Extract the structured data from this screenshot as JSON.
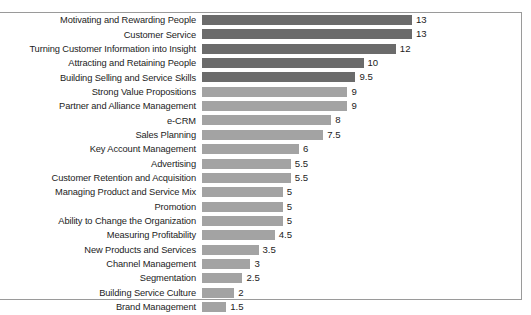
{
  "chart_data": {
    "type": "bar",
    "orientation": "horizontal",
    "title": "",
    "subtitle": "",
    "xlabel": "",
    "ylabel": "",
    "xlim": [
      0,
      13
    ],
    "grid": false,
    "legend": "none",
    "value_label_position": "outside-end",
    "colors": {
      "high_group": "#6b6b6b",
      "low_group": "#a3a3a3",
      "frame": "#9a9a9a",
      "background": "#ffffff",
      "text": "#1c1c1c"
    },
    "categories": [
      "Motivating and Rewarding People",
      "Customer Service",
      "Turning Customer Information into Insight",
      "Attracting and Retaining People",
      "Building Selling and Service Skills",
      "Strong Value Propositions",
      "Partner and Alliance Management",
      "e-CRM",
      "Sales Planning",
      "Key Account Management",
      "Advertising",
      "Customer Retention and Acquisition",
      "Managing Product and Service Mix",
      "Promotion",
      "Ability to Change the Organization",
      "Measuring Profitability",
      "New Products and Services",
      "Channel Management",
      "Segmentation",
      "Building Service Culture",
      "Brand Management"
    ],
    "values": [
      13,
      13,
      12,
      10,
      9.5,
      9,
      9,
      8,
      7.5,
      6,
      5.5,
      5.5,
      5,
      5,
      5,
      4.5,
      3.5,
      3,
      2.5,
      2,
      1.5
    ],
    "value_labels": [
      "13",
      "13",
      "12",
      "10",
      "9.5",
      "9",
      "9",
      "8",
      "7.5",
      "6",
      "5.5",
      "5.5",
      "5",
      "5",
      "5",
      "4.5",
      "3.5",
      "3",
      "2.5",
      "2",
      "1.5"
    ],
    "series_groups": [
      "dark",
      "dark",
      "dark",
      "dark",
      "dark",
      "light",
      "light",
      "light",
      "light",
      "light",
      "light",
      "light",
      "light",
      "light",
      "light",
      "light",
      "light",
      "light",
      "light",
      "light",
      "light"
    ]
  }
}
